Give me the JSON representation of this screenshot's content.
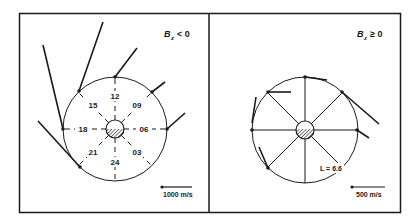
{
  "panels": [
    {
      "id": "bz-negative",
      "title": {
        "symbol": "B",
        "subscript": "z",
        "relation": "< 0"
      },
      "local_times": [
        "12",
        "15",
        "09",
        "18",
        "06",
        "21",
        "24",
        "03"
      ],
      "scale_bar": {
        "label": "1000 m/s"
      }
    },
    {
      "id": "bz-positive",
      "title": {
        "symbol": "B",
        "subscript": "z",
        "relation": "≥ 0"
      },
      "l_shell_label": "L = 6.6",
      "scale_bar": {
        "label": "500 m/s"
      }
    }
  ],
  "colors": {
    "ink": "#1a1a1a",
    "background": "#ffffff"
  }
}
